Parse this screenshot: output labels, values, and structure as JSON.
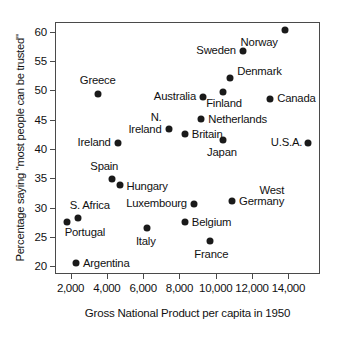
{
  "chart_data": {
    "type": "scatter",
    "title": "",
    "xlabel": "Gross National Product per capita in 1950",
    "ylabel": "Percentage saying \"most people can be trusted\"",
    "xlim": [
      1200,
      15800
    ],
    "ylim": [
      18.5,
      61.5
    ],
    "xticks": [
      2000,
      4000,
      6000,
      8000,
      10000,
      12000,
      14000
    ],
    "xticklabels": [
      "2,000",
      "4,000",
      "6,000",
      "8,000",
      "10,000",
      "12,000",
      "14,000"
    ],
    "yticks": [
      20,
      25,
      30,
      35,
      40,
      45,
      50,
      55,
      60
    ],
    "yticklabels": [
      "20",
      "25",
      "30",
      "35",
      "40",
      "45",
      "50",
      "55",
      "60"
    ],
    "grid": false,
    "legend": "none",
    "marker_color": "#1a1a1a",
    "axis_color": "#4a4a4a",
    "points": [
      {
        "label": "Norway",
        "x": 13800,
        "y": 60.3,
        "lpos": "left",
        "ldx": -7,
        "ldy": 13
      },
      {
        "label": "Sweden",
        "x": 11500,
        "y": 56.7,
        "lpos": "left",
        "ldx": -7,
        "ldy": 0
      },
      {
        "label": "Denmark",
        "x": 10800,
        "y": 52.2,
        "lpos": "right",
        "ldx": 7,
        "ldy": -6
      },
      {
        "label": "Finland",
        "x": 10400,
        "y": 49.8,
        "lpos": "center",
        "ldx": 1,
        "ldy": 12
      },
      {
        "label": "Canada",
        "x": 13000,
        "y": 48.6,
        "lpos": "right",
        "ldx": 7,
        "ldy": 0
      },
      {
        "label": "Australia",
        "x": 9300,
        "y": 48.8,
        "lpos": "left",
        "ldx": -7,
        "ldy": 0
      },
      {
        "label": "Greece",
        "x": 3500,
        "y": 49.3,
        "lpos": "center",
        "ldx": 0,
        "ldy": -13
      },
      {
        "label": "Netherlands",
        "x": 9200,
        "y": 45.1,
        "lpos": "right",
        "ldx": 7,
        "ldy": 1
      },
      {
        "label": "N.\nIreland",
        "x": 7400,
        "y": 43.4,
        "lpos": "left",
        "ldx": -7,
        "ldy": -6
      },
      {
        "label": "Britain",
        "x": 8300,
        "y": 42.6,
        "lpos": "right",
        "ldx": 7,
        "ldy": 1
      },
      {
        "label": "Japan",
        "x": 10400,
        "y": 41.6,
        "lpos": "center",
        "ldx": -1,
        "ldy": 13
      },
      {
        "label": "U.S.A.",
        "x": 15100,
        "y": 41.1,
        "lpos": "left",
        "ldx": -6,
        "ldy": 0
      },
      {
        "label": "Ireland",
        "x": 4600,
        "y": 41.0,
        "lpos": "left",
        "ldx": -7,
        "ldy": 0
      },
      {
        "label": "Spain",
        "x": 4300,
        "y": 34.8,
        "lpos": "center",
        "ldx": -8,
        "ldy": -12
      },
      {
        "label": "Hungary",
        "x": 4700,
        "y": 33.8,
        "lpos": "right",
        "ldx": 7,
        "ldy": 2
      },
      {
        "label": "West\nGermany",
        "x": 10900,
        "y": 31.2,
        "lpos": "right",
        "ldx": 7,
        "ldy": -5
      },
      {
        "label": "Luxembourg",
        "x": 8800,
        "y": 30.6,
        "lpos": "left",
        "ldx": -7,
        "ldy": 0
      },
      {
        "label": "S. Africa",
        "x": 2400,
        "y": 28.3,
        "lpos": "center",
        "ldx": 12,
        "ldy": -12
      },
      {
        "label": "Portugal",
        "x": 1800,
        "y": 27.5,
        "lpos": "center",
        "ldx": 18,
        "ldy": 11
      },
      {
        "label": "Belgium",
        "x": 8300,
        "y": 27.5,
        "lpos": "right",
        "ldx": 7,
        "ldy": 1
      },
      {
        "label": "Italy",
        "x": 6200,
        "y": 26.5,
        "lpos": "center",
        "ldx": -1,
        "ldy": 14
      },
      {
        "label": "France",
        "x": 9700,
        "y": 24.3,
        "lpos": "center",
        "ldx": 1,
        "ldy": 14
      },
      {
        "label": "Argentina",
        "x": 2300,
        "y": 20.5,
        "lpos": "right",
        "ldx": 7,
        "ldy": 1
      }
    ]
  }
}
